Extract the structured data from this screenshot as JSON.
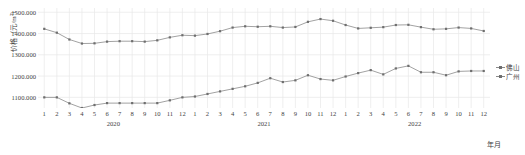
{
  "chart_data": {
    "type": "line",
    "title": "",
    "xlabel": "年月",
    "ylabel": "价格（元/m²）",
    "ylim": [
      1050,
      1520
    ],
    "yticks": [
      1100,
      1200,
      1300,
      1400,
      1500
    ],
    "ytick_labels": [
      "1100.000",
      "1200.000",
      "1300.000",
      "1400.000",
      "1500.000"
    ],
    "grid": true,
    "legend_position": "right",
    "categories": [
      "1",
      "2",
      "3",
      "4",
      "5",
      "6",
      "7",
      "8",
      "9",
      "10",
      "11",
      "12",
      "1",
      "2",
      "3",
      "4",
      "5",
      "6",
      "7",
      "8",
      "9",
      "10",
      "11",
      "12",
      "1",
      "2",
      "3",
      "4",
      "5",
      "6",
      "7",
      "8",
      "9",
      "10",
      "11",
      "12"
    ],
    "year_groups": [
      {
        "label": "2020",
        "start_index": 0,
        "end_index": 11
      },
      {
        "label": "2021",
        "start_index": 12,
        "end_index": 23
      },
      {
        "label": "2022",
        "start_index": 24,
        "end_index": 35
      }
    ],
    "series": [
      {
        "name": "佛山",
        "color": "#8a8a8a",
        "marker": "square",
        "values": [
          1422,
          1404,
          1372,
          1353,
          1354,
          1362,
          1364,
          1364,
          1362,
          1368,
          1382,
          1392,
          1390,
          1398,
          1411,
          1428,
          1434,
          1432,
          1434,
          1428,
          1431,
          1455,
          1468,
          1460,
          1440,
          1424,
          1427,
          1430,
          1440,
          1441,
          1430,
          1420,
          1422,
          1428,
          1424,
          1412
        ]
      },
      {
        "name": "广州",
        "color": "#8a8a8a",
        "marker": "square",
        "values": [
          1100,
          1100,
          1072,
          1050,
          1064,
          1073,
          1073,
          1073,
          1073,
          1073,
          1086,
          1100,
          1104,
          1116,
          1128,
          1140,
          1152,
          1168,
          1190,
          1172,
          1180,
          1204,
          1186,
          1180,
          1198,
          1214,
          1228,
          1208,
          1236,
          1248,
          1218,
          1218,
          1204,
          1222,
          1224,
          1224
        ]
      }
    ]
  },
  "legend": {
    "items": [
      {
        "label": "佛山"
      },
      {
        "label": "广州"
      }
    ]
  },
  "axes": {
    "y_title": "价格（元/m",
    "y_title_sup": "2",
    "y_title_tail": "）",
    "x_unit": "年月"
  },
  "style": {
    "line_color": "#8a8a8a",
    "marker_color": "#6e6e6e",
    "grid_color": "#e8e8e8",
    "text_color": "#3f3f3f",
    "background": "#ffffff"
  }
}
